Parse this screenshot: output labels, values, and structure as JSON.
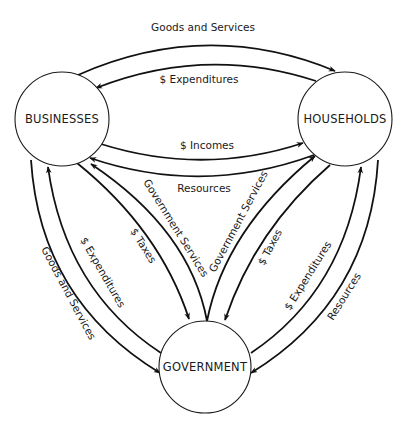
{
  "diagram": {
    "type": "circular-flow",
    "nodes": {
      "businesses": {
        "label": "BUSINESSES"
      },
      "households": {
        "label": "HOUSEHOLDS"
      },
      "government": {
        "label": "GOVERNMENT"
      }
    },
    "flows": {
      "bus_to_hh_goods": {
        "label": "Goods and Services",
        "from": "BUSINESSES",
        "to": "HOUSEHOLDS"
      },
      "hh_to_bus_expend": {
        "label": "$ Expenditures",
        "from": "HOUSEHOLDS",
        "to": "BUSINESSES"
      },
      "bus_to_hh_incomes": {
        "label": "$ Incomes",
        "from": "BUSINESSES",
        "to": "HOUSEHOLDS"
      },
      "hh_to_bus_resources": {
        "label": "Resources",
        "from": "HOUSEHOLDS",
        "to": "BUSINESSES"
      },
      "gov_to_bus_services": {
        "label": "Government Services",
        "from": "GOVERNMENT",
        "to": "BUSINESSES"
      },
      "bus_to_gov_taxes": {
        "label": "$ Taxes",
        "from": "BUSINESSES",
        "to": "GOVERNMENT"
      },
      "gov_to_hh_services": {
        "label": "Government Services",
        "from": "GOVERNMENT",
        "to": "HOUSEHOLDS"
      },
      "hh_to_gov_taxes": {
        "label": "$ Taxes",
        "from": "HOUSEHOLDS",
        "to": "GOVERNMENT"
      },
      "bus_to_gov_goods": {
        "label": "Goods and Services",
        "from": "BUSINESSES",
        "to": "GOVERNMENT"
      },
      "gov_to_bus_expend": {
        "label": "$ Expenditures",
        "from": "GOVERNMENT",
        "to": "BUSINESSES"
      },
      "gov_to_hh_expend": {
        "label": "$ Expenditures",
        "from": "GOVERNMENT",
        "to": "HOUSEHOLDS"
      },
      "hh_to_gov_resources": {
        "label": "Resources",
        "from": "HOUSEHOLDS",
        "to": "GOVERNMENT"
      }
    }
  }
}
